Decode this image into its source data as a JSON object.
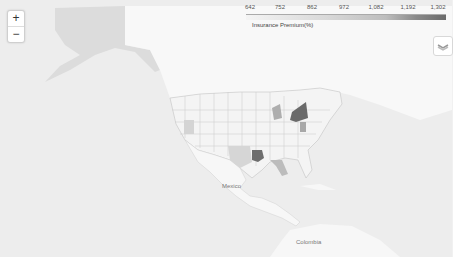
{
  "map": {
    "zoom_in_label": "+",
    "zoom_out_label": "−",
    "layers_icon": "layers-icon",
    "place_labels": {
      "mexico": "Mexico",
      "colombia": "Colombia"
    }
  },
  "legend": {
    "title": "Insurance Premium(%)",
    "ticks": [
      "642",
      "752",
      "862",
      "972",
      "1,082",
      "1,192",
      "1,302"
    ],
    "colors": [
      "#f4f4f4",
      "#d9d9d9",
      "#bdbdbd",
      "#8a8a8a",
      "#6a6a6a"
    ]
  },
  "highlighted_states": {
    "darkest": [
      "Louisiana",
      "New York"
    ],
    "dark": [
      "Michigan",
      "Florida",
      "Texas"
    ]
  }
}
